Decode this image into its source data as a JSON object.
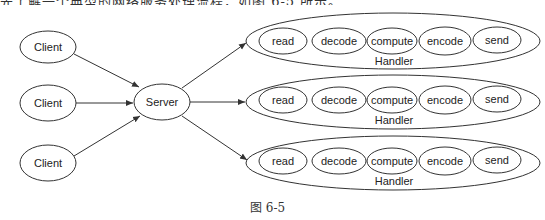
{
  "top_text": "先了解一个典型的网络服务处理流程，如图 6-5 所示。",
  "caption": "图 6-5",
  "colors": {
    "stroke": "#333333",
    "text": "#222222",
    "background": "#ffffff"
  },
  "clients": [
    {
      "label": "Client"
    },
    {
      "label": "Client"
    },
    {
      "label": "Client"
    }
  ],
  "server": {
    "label": "Server"
  },
  "handlers": [
    {
      "label": "Handler",
      "stages": [
        "read",
        "decode",
        "compute",
        "encode",
        "send"
      ]
    },
    {
      "label": "Handler",
      "stages": [
        "read",
        "decode",
        "compute",
        "encode",
        "send"
      ]
    },
    {
      "label": "Handler",
      "stages": [
        "read",
        "decode",
        "compute",
        "encode",
        "send"
      ]
    }
  ],
  "edges": [
    {
      "from": "Client 1",
      "to": "Server"
    },
    {
      "from": "Client 2",
      "to": "Server"
    },
    {
      "from": "Client 3",
      "to": "Server"
    },
    {
      "from": "Server",
      "to": "Handler 1"
    },
    {
      "from": "Server",
      "to": "Handler 2"
    },
    {
      "from": "Server",
      "to": "Handler 3"
    }
  ]
}
